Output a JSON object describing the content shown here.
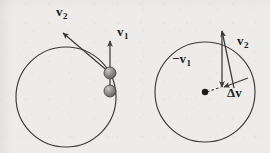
{
  "figure": {
    "background_color": "#eeecea",
    "stroke_color": "#3a3a3a",
    "bead_color": "#8a8a8a",
    "dot_color": "#1b1b1b"
  },
  "left_panel": {
    "name": "circular-path-with-two-positions",
    "circle": {
      "cx": 66,
      "cy": 97,
      "r": 50
    },
    "beads": [
      {
        "name": "bead-position-1",
        "cx": 110,
        "cy": 73,
        "r": 6
      },
      {
        "name": "bead-position-2",
        "cx": 110,
        "cy": 91,
        "r": 6
      }
    ],
    "vectors": [
      {
        "name": "velocity-v1",
        "label": "v",
        "subscript": "1",
        "from": [
          110,
          91
        ],
        "to": [
          110,
          41
        ],
        "label_x": 118,
        "label_y": 27
      },
      {
        "name": "velocity-v2",
        "label": "v",
        "subscript": "2",
        "from": [
          110,
          73
        ],
        "to": [
          63,
          33
        ],
        "label_x": 60,
        "label_y": 7
      }
    ]
  },
  "right_panel": {
    "name": "vector-difference-construction",
    "circle": {
      "cx": 205,
      "cy": 92,
      "r": 50
    },
    "center_dot": {
      "name": "center-dot",
      "cx": 205,
      "cy": 92,
      "r": 3
    },
    "vectors": [
      {
        "name": "negative-velocity-v1",
        "label": "−v",
        "subscript": "1",
        "from": [
          222,
          31
        ],
        "to": [
          222,
          87
        ],
        "label_x": 176,
        "label_y": 54
      },
      {
        "name": "velocity-v2",
        "label": "v",
        "subscript": "2",
        "from": [
          234,
          88
        ],
        "to": [
          222,
          31
        ],
        "label_x": 238,
        "label_y": 36
      },
      {
        "name": "delta-v",
        "label": "Δv",
        "subscript": "",
        "from": [
          248,
          78
        ],
        "to": [
          223,
          88
        ],
        "label_x": 230,
        "label_y": 88
      }
    ],
    "dashed_line": {
      "name": "radius-dashed-line",
      "from": [
        207,
        92
      ],
      "to": [
        222,
        87
      ]
    }
  }
}
